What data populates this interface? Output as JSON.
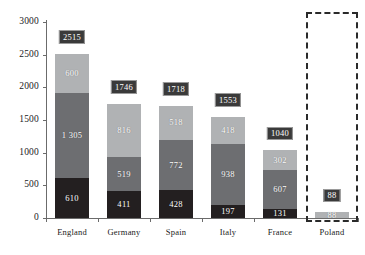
{
  "chart_data": {
    "type": "bar",
    "subtype": "stacked-bar",
    "title": "",
    "xlabel": "",
    "ylabel": "",
    "ylim": [
      0,
      3000
    ],
    "yticks": [
      "0",
      "500",
      "1000",
      "1500",
      "2000",
      "2500",
      "3000"
    ],
    "ytick_values": [
      0,
      500,
      1000,
      1500,
      2000,
      2500,
      3000
    ],
    "grid": false,
    "legend": "none",
    "categories": [
      "England",
      "Germany",
      "Spain",
      "Italy",
      "France",
      "Poland"
    ],
    "series": [
      {
        "name": "segment-bottom",
        "color": "#231f20",
        "values": [
          610,
          411,
          428,
          197,
          131,
          0
        ]
      },
      {
        "name": "segment-middle",
        "color": "#6d6e71",
        "values": [
          1305,
          519,
          772,
          938,
          607,
          0
        ]
      },
      {
        "name": "segment-top",
        "color": "#b0b2b4",
        "values": [
          600,
          816,
          518,
          418,
          302,
          88
        ]
      }
    ],
    "totals": [
      2515,
      1746,
      1718,
      1553,
      1040,
      88
    ],
    "bars": [
      {
        "category": "England",
        "total_label": "2515",
        "segments": [
          {
            "label": "610",
            "value": 610,
            "color": "#231f20"
          },
          {
            "label": "1 305",
            "value": 1305,
            "color": "#6d6e71"
          },
          {
            "label": "600",
            "value": 600,
            "color": "#b0b2b4"
          }
        ]
      },
      {
        "category": "Germany",
        "total_label": "1746",
        "segments": [
          {
            "label": "411",
            "value": 411,
            "color": "#231f20"
          },
          {
            "label": "519",
            "value": 519,
            "color": "#6d6e71"
          },
          {
            "label": "816",
            "value": 816,
            "color": "#b0b2b4"
          }
        ]
      },
      {
        "category": "Spain",
        "total_label": "1718",
        "segments": [
          {
            "label": "428",
            "value": 428,
            "color": "#231f20"
          },
          {
            "label": "772",
            "value": 772,
            "color": "#6d6e71"
          },
          {
            "label": "518",
            "value": 518,
            "color": "#b0b2b4"
          }
        ]
      },
      {
        "category": "Italy",
        "total_label": "1553",
        "segments": [
          {
            "label": "197",
            "value": 197,
            "color": "#231f20"
          },
          {
            "label": "938",
            "value": 938,
            "color": "#6d6e71"
          },
          {
            "label": "418",
            "value": 418,
            "color": "#b0b2b4"
          }
        ]
      },
      {
        "category": "France",
        "total_label": "1040",
        "segments": [
          {
            "label": "131",
            "value": 131,
            "color": "#231f20"
          },
          {
            "label": "607",
            "value": 607,
            "color": "#6d6e71"
          },
          {
            "label": "302",
            "value": 302,
            "color": "#b0b2b4"
          }
        ]
      },
      {
        "category": "Poland",
        "total_label": "88",
        "segments": [
          {
            "label": "",
            "value": 0,
            "color": "#231f20"
          },
          {
            "label": "",
            "value": 0,
            "color": "#6d6e71"
          },
          {
            "label": "88",
            "value": 88,
            "color": "#b0b2b4"
          }
        ]
      }
    ],
    "annotations": [
      {
        "name": "poland-highlight",
        "style": "dash-dot-rectangle",
        "color": "#2a2a2a",
        "covers": "Poland"
      }
    ]
  },
  "colors": {
    "axis": "#6b6b6b",
    "text": "#1a1a1a",
    "badge_background": "#3a3a3a",
    "badge_border": "#9a9a9a",
    "segment_bottom": "#231f20",
    "segment_middle": "#6d6e71",
    "segment_top": "#b0b2b4",
    "highlight": "#2a2a2a",
    "background": "#ffffff"
  }
}
